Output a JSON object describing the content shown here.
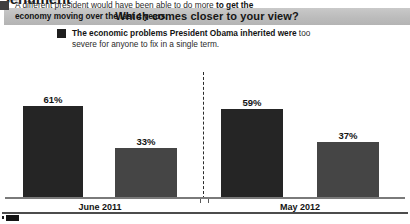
{
  "section_heading": "Sentiment",
  "question_banner": {
    "text": "Which comes closer to your view?"
  },
  "legend": {
    "items": [
      {
        "swatch_color": "#1e1e1e",
        "bold_part": "The economic problems President Obama inherited were ",
        "regular_part": "too severe for anyone to fix in a single term."
      },
      {
        "swatch_color": "#3f3f3f",
        "bold_part_leading": "A different president would have been able to do more ",
        "bold_tail": "to get the economy moving over the last 4 years."
      }
    ]
  },
  "footnote": {
    "marker": "cropped-source-mark"
  },
  "chart_data": {
    "type": "bar",
    "title": "Which comes closer to your view?",
    "xlabel": "",
    "ylabel": "",
    "ylim": [
      0,
      70
    ],
    "grid": false,
    "legend_position": "top",
    "categories": [
      "June 2011",
      "May 2012"
    ],
    "series": [
      {
        "name": "The economic problems President Obama inherited were too severe for anyone to fix in a single term.",
        "color": "#252525",
        "values": [
          61,
          59
        ],
        "labels": [
          "61%",
          "59%"
        ]
      },
      {
        "name": "A different president would have been able to do more to get the economy moving over the last 4 years.",
        "color": "#454545",
        "values": [
          33,
          37
        ],
        "labels": [
          "33%",
          "37%"
        ]
      }
    ],
    "annotations": [
      {
        "type": "vertical-dashed-divider",
        "between": [
          "June 2011",
          "May 2012"
        ]
      }
    ]
  }
}
